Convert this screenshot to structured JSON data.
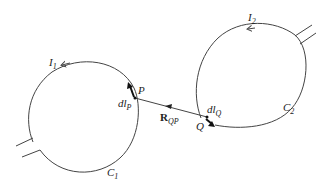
{
  "diagram": {
    "title": "",
    "loop1": {
      "current_label": "I",
      "current_sub": "1",
      "curve_label": "C",
      "curve_sub": "1",
      "point_label": "P",
      "element_label": "dl",
      "element_sub": "P"
    },
    "loop2": {
      "current_label": "I",
      "current_sub": "2",
      "curve_label": "C",
      "curve_sub": "2",
      "point_label": "Q",
      "element_label": "dl",
      "element_sub": "Q"
    },
    "vector": {
      "label": "R",
      "sub": "QP"
    },
    "colors": {
      "line": "#444444",
      "text": "#222222"
    }
  }
}
